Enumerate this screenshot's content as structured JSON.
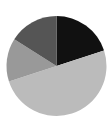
{
  "chart_data": {
    "type": "pie",
    "title": "",
    "categories": [
      "Slice A",
      "Slice B",
      "Slice C",
      "Slice D"
    ],
    "values": [
      20,
      50,
      14,
      16
    ],
    "colors": [
      "#111111",
      "#bbbbbb",
      "#999999",
      "#555555"
    ],
    "start_angle_deg": 0,
    "direction": "clockwise",
    "legend": "none",
    "labels_shown": false
  },
  "layout": {
    "center_x": 56.5,
    "center_y": 66,
    "radius": 50,
    "background": "#ffffff"
  }
}
